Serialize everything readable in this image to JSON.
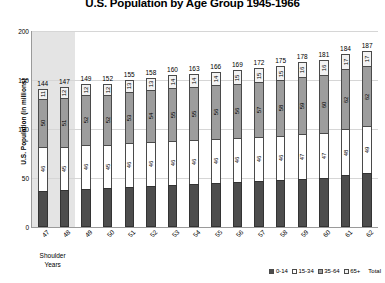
{
  "chart_data": {
    "type": "bar",
    "subtype": "stacked-column",
    "title": "U.S. Population by Age Group 1945-1966",
    "xlabel": "",
    "ylabel": "U.S. Population (in millions)",
    "ylim": [
      0,
      200
    ],
    "yticks": [
      0,
      50,
      100,
      150,
      200
    ],
    "grid": true,
    "legend_position": "bottom-right",
    "categories": [
      "47",
      "48",
      "49",
      "50",
      "51",
      "52",
      "53",
      "54",
      "55",
      "56",
      "57",
      "58",
      "59",
      "60",
      "61",
      "62"
    ],
    "series": [
      {
        "name": "0-14",
        "color": "#4d4d4d",
        "values": [
          37,
          38,
          39,
          40,
          41,
          42,
          43,
          44,
          45,
          46,
          47,
          48,
          49,
          50,
          53,
          55
        ],
        "labels": [
          "",
          "",
          "",
          "",
          "",
          "",
          "",
          "",
          "",
          "",
          "",
          "",
          "",
          "",
          "",
          ""
        ]
      },
      {
        "name": "15-34",
        "color": "#ffffff",
        "values": [
          46,
          45,
          46,
          45,
          46,
          46,
          46,
          46,
          46,
          46,
          46,
          46,
          47,
          47,
          48,
          49
        ],
        "labels": [
          "46",
          "45",
          "46",
          "45",
          "46",
          "46",
          "46",
          "46",
          "46",
          "46",
          "46",
          "46",
          "47",
          "47",
          "48",
          "49"
        ]
      },
      {
        "name": "35-64",
        "color": "#9d9d9d",
        "values": [
          50,
          51,
          52,
          52,
          53,
          54,
          55,
          55,
          56,
          56,
          57,
          58,
          59,
          60,
          62,
          62
        ],
        "labels": [
          "50",
          "51",
          "52",
          "52",
          "53",
          "54",
          "55",
          "55",
          "56",
          "56",
          "57",
          "58",
          "59",
          "60",
          "62",
          "62"
        ]
      },
      {
        "name": "65+",
        "color": "#f2f2f2",
        "values": [
          11,
          12,
          12,
          12,
          13,
          13,
          14,
          14,
          14,
          15,
          15,
          15,
          16,
          16,
          17,
          17
        ],
        "labels": [
          "11",
          "12",
          "12",
          "12",
          "13",
          "13",
          "14",
          "14",
          "14",
          "15",
          "15",
          "15",
          "16",
          "16",
          "17",
          "17"
        ]
      }
    ],
    "totals": [
      144,
      147,
      149,
      152,
      155,
      158,
      160,
      163,
      166,
      169,
      172,
      175,
      178,
      181,
      184,
      187
    ],
    "legend": [
      {
        "label": "0-14",
        "color": "#4d4d4d"
      },
      {
        "label": "15-34",
        "color": "#ffffff"
      },
      {
        "label": "35-64",
        "color": "#9d9d9d"
      },
      {
        "label": "65+",
        "color": "#f2f2f2"
      }
    ],
    "legend_extra": "Total",
    "annotations": [
      {
        "name": "shoulder-years",
        "text_line1": "Shoulder",
        "text_line2": "Years",
        "highlight_categories": [
          "47",
          "48"
        ],
        "highlight_color": "#e4e4e4"
      }
    ]
  }
}
